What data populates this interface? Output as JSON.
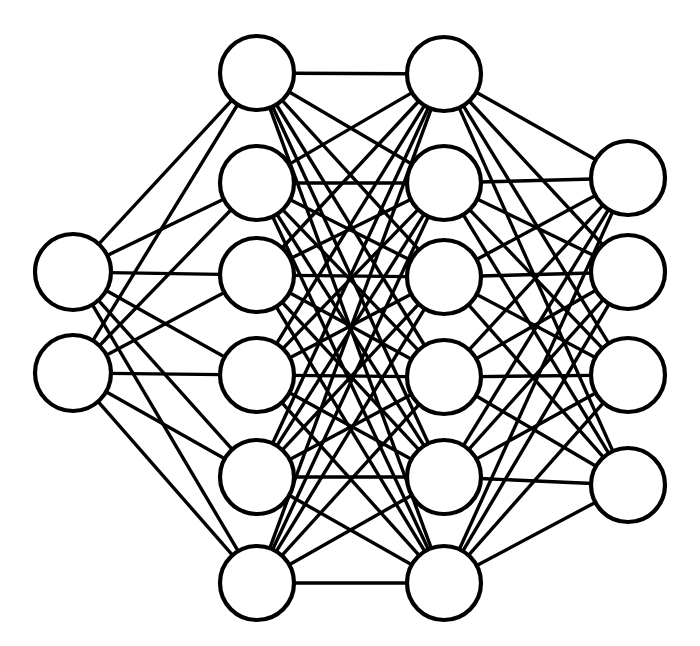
{
  "diagram": {
    "kind": "neural-network-graph",
    "canvas": {
      "width": 700,
      "height": 646
    },
    "style": {
      "background_color": "#ffffff",
      "node_fill_color": "#ffffff",
      "node_stroke_color": "#000000",
      "node_stroke_width": 4.2,
      "edge_color": "#000000",
      "edge_width": 3.4
    },
    "architecture_summary": "2 - 6 - 6 - 4",
    "layer_count": 4,
    "node_count_total": 18,
    "edge_count_total": 72,
    "layers": [
      {
        "name": "input-layer",
        "role": "input",
        "index": 0,
        "node_count": 2,
        "center_x": 73,
        "node_radius": 38,
        "nodes": [
          {
            "id": "L0N0",
            "cx": 73,
            "cy": 272,
            "r": 38
          },
          {
            "id": "L0N1",
            "cx": 73,
            "cy": 373,
            "r": 38
          }
        ]
      },
      {
        "name": "hidden-layer-1",
        "role": "hidden",
        "index": 1,
        "node_count": 6,
        "center_x": 257,
        "node_radius": 37,
        "nodes": [
          {
            "id": "L1N0",
            "cx": 257,
            "cy": 73,
            "r": 37
          },
          {
            "id": "L1N1",
            "cx": 257,
            "cy": 183,
            "r": 37
          },
          {
            "id": "L1N2",
            "cx": 257,
            "cy": 275,
            "r": 37
          },
          {
            "id": "L1N3",
            "cx": 257,
            "cy": 375,
            "r": 37
          },
          {
            "id": "L1N4",
            "cx": 257,
            "cy": 477,
            "r": 37
          },
          {
            "id": "L1N5",
            "cx": 257,
            "cy": 583,
            "r": 37
          }
        ]
      },
      {
        "name": "hidden-layer-2",
        "role": "hidden",
        "index": 2,
        "node_count": 6,
        "center_x": 444,
        "node_radius": 37,
        "nodes": [
          {
            "id": "L2N0",
            "cx": 444,
            "cy": 74,
            "r": 37
          },
          {
            "id": "L2N1",
            "cx": 444,
            "cy": 183,
            "r": 37
          },
          {
            "id": "L2N2",
            "cx": 444,
            "cy": 277,
            "r": 37
          },
          {
            "id": "L2N3",
            "cx": 444,
            "cy": 377,
            "r": 37
          },
          {
            "id": "L2N4",
            "cx": 444,
            "cy": 477,
            "r": 37
          },
          {
            "id": "L2N5",
            "cx": 444,
            "cy": 583,
            "r": 37
          }
        ]
      },
      {
        "name": "output-layer",
        "role": "output",
        "index": 3,
        "node_count": 4,
        "center_x": 628,
        "node_radius": 37,
        "nodes": [
          {
            "id": "L3N0",
            "cx": 628,
            "cy": 178,
            "r": 37
          },
          {
            "id": "L3N1",
            "cx": 628,
            "cy": 272,
            "r": 37
          },
          {
            "id": "L3N2",
            "cx": 628,
            "cy": 375,
            "r": 37
          },
          {
            "id": "L3N3",
            "cx": 628,
            "cy": 485,
            "r": 37
          }
        ]
      }
    ],
    "connections": [
      {
        "from_layer": 0,
        "to_layer": 1,
        "pattern": "fully-connected",
        "edge_count": 12
      },
      {
        "from_layer": 1,
        "to_layer": 2,
        "pattern": "fully-connected",
        "edge_count": 36
      },
      {
        "from_layer": 2,
        "to_layer": 3,
        "pattern": "fully-connected",
        "edge_count": 24
      }
    ]
  }
}
